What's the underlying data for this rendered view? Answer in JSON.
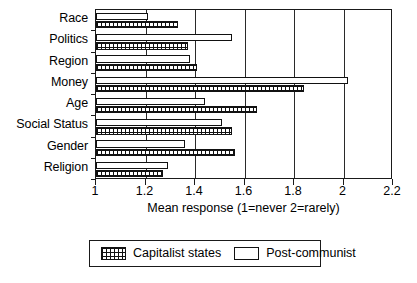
{
  "chart_data": {
    "type": "bar",
    "orientation": "horizontal",
    "title": "",
    "xlabel": "Mean response (1=never 2=rarely)",
    "ylabel": "",
    "xlim": [
      1,
      2.2
    ],
    "xticks": [
      1,
      1.2,
      1.4,
      1.6,
      1.8,
      2,
      2.2
    ],
    "xticklabels": [
      "1",
      "1.2",
      "1.4",
      "1.6",
      "1.8",
      "2",
      "2.2"
    ],
    "grid": true,
    "grid_axis": "x",
    "legend_position": "below-center",
    "categories": [
      "Race",
      "Politics",
      "Region",
      "Money",
      "Age",
      "Social Status",
      "Gender",
      "Religion"
    ],
    "series": [
      {
        "name": "Post-communist",
        "fill": "white",
        "values": [
          1.21,
          1.55,
          1.38,
          2.02,
          1.44,
          1.51,
          1.36,
          1.29
        ]
      },
      {
        "name": "Capitalist states",
        "fill": "cross-hatch",
        "values": [
          1.33,
          1.37,
          1.41,
          1.84,
          1.65,
          1.55,
          1.56,
          1.27
        ]
      }
    ]
  },
  "legend": {
    "entries": [
      {
        "label": "Capitalist states",
        "swatch": "cross-hatch"
      },
      {
        "label": "Post-communist",
        "swatch": "white"
      }
    ]
  },
  "colors": {
    "axis": "#1a1a1a",
    "bar_outline": "#111111",
    "background": "#ffffff"
  }
}
